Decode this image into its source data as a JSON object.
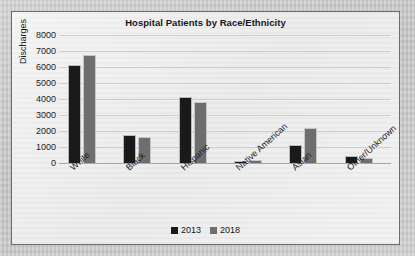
{
  "chart_data": {
    "type": "bar",
    "title": "Hospital Patients by Race/Ethnicity",
    "xlabel": "",
    "ylabel": "Discharges",
    "ylim": [
      0,
      8000
    ],
    "ytick_step": 1000,
    "yticks": [
      "8000",
      "7000",
      "6000",
      "5000",
      "4000",
      "3000",
      "2000",
      "1000",
      "0"
    ],
    "grid": true,
    "legend_position": "bottom-center",
    "categories": [
      "White",
      "Black",
      "Hispanic",
      "Native American",
      "Asian",
      "Other/Unknown"
    ],
    "series": [
      {
        "name": "2013",
        "color": "#1a1a1a",
        "values": [
          6100,
          1750,
          4100,
          150,
          1100,
          450
        ]
      },
      {
        "name": "2018",
        "color": "#6e6e6e",
        "values": [
          6750,
          1650,
          3800,
          160,
          2200,
          300
        ]
      }
    ]
  },
  "colors": {
    "series_2013": "#1a1a1a",
    "series_2018": "#6e6e6e",
    "panel_background": "#efefef",
    "panel_border": "#6d6d6d",
    "page_background": "#c9c9c9",
    "gridline": "#cfcfcf",
    "axis": "#a8a8a8",
    "text": "#1d2126"
  }
}
